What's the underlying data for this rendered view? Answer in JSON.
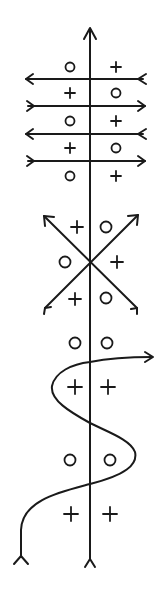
{
  "diagram": {
    "title": "",
    "colors": {
      "stroke": "#1a1a1a",
      "background": "#ffffff"
    },
    "axis": {
      "x": 90,
      "top": 28,
      "bottom": 560,
      "head": "arrow-up",
      "tail": "fletching"
    },
    "section_parallel": {
      "lines": [
        {
          "y": 79,
          "direction": "left"
        },
        {
          "y": 106,
          "direction": "right"
        },
        {
          "y": 134,
          "direction": "left"
        },
        {
          "y": 161,
          "direction": "right"
        }
      ],
      "symbols": [
        {
          "x": 70,
          "y": 67,
          "type": "circle"
        },
        {
          "x": 116,
          "y": 67,
          "type": "plus"
        },
        {
          "x": 70,
          "y": 93,
          "type": "plus"
        },
        {
          "x": 116,
          "y": 93,
          "type": "circle"
        },
        {
          "x": 70,
          "y": 121,
          "type": "circle"
        },
        {
          "x": 116,
          "y": 121,
          "type": "plus"
        },
        {
          "x": 70,
          "y": 148,
          "type": "plus"
        },
        {
          "x": 116,
          "y": 148,
          "type": "circle"
        },
        {
          "x": 70,
          "y": 176,
          "type": "circle"
        },
        {
          "x": 116,
          "y": 176,
          "type": "plus"
        }
      ]
    },
    "section_cross": {
      "center": [
        90,
        262
      ],
      "symbols": [
        {
          "x": 77,
          "y": 227,
          "type": "plus"
        },
        {
          "x": 106,
          "y": 227,
          "type": "circle"
        },
        {
          "x": 65,
          "y": 262,
          "type": "circle"
        },
        {
          "x": 117,
          "y": 262,
          "type": "plus"
        },
        {
          "x": 75,
          "y": 299,
          "type": "plus"
        },
        {
          "x": 106,
          "y": 299,
          "type": "circle"
        }
      ]
    },
    "section_sine": {
      "symbols": [
        {
          "x": 75,
          "y": 343,
          "type": "circle"
        },
        {
          "x": 107,
          "y": 343,
          "type": "circle"
        },
        {
          "x": 75,
          "y": 387,
          "type": "plus"
        },
        {
          "x": 108,
          "y": 387,
          "type": "plus"
        },
        {
          "x": 70,
          "y": 460,
          "type": "circle"
        },
        {
          "x": 110,
          "y": 460,
          "type": "circle"
        },
        {
          "x": 71,
          "y": 514,
          "type": "plus"
        },
        {
          "x": 110,
          "y": 514,
          "type": "plus"
        }
      ]
    }
  }
}
